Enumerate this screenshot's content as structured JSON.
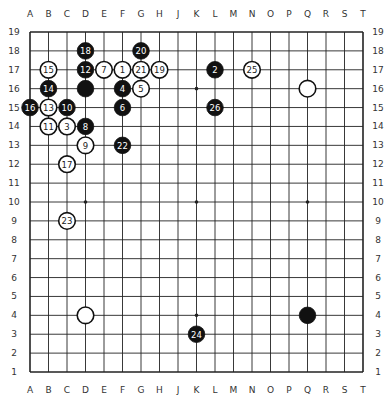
{
  "board": {
    "size": 19,
    "columns": [
      "A",
      "B",
      "C",
      "D",
      "E",
      "F",
      "G",
      "H",
      "J",
      "K",
      "L",
      "M",
      "N",
      "O",
      "P",
      "Q",
      "R",
      "S",
      "T"
    ],
    "rows": [
      "19",
      "18",
      "17",
      "16",
      "15",
      "14",
      "13",
      "12",
      "11",
      "10",
      "9",
      "8",
      "7",
      "6",
      "5",
      "4",
      "3",
      "2",
      "1"
    ],
    "star_points": [
      "D16",
      "K16",
      "Q16",
      "D10",
      "K10",
      "Q10",
      "D4",
      "K4",
      "Q4"
    ],
    "colors": {
      "background": "#ffffff",
      "line": "#222222",
      "black_stone": "#111111",
      "white_stone": "#ffffff",
      "label": "#333333"
    }
  },
  "stones": [
    {
      "pos": "F17",
      "color": "white",
      "num": "1"
    },
    {
      "pos": "L17",
      "color": "black",
      "num": "2"
    },
    {
      "pos": "C14",
      "color": "white",
      "num": "3"
    },
    {
      "pos": "F16",
      "color": "black",
      "num": "4"
    },
    {
      "pos": "G16",
      "color": "white",
      "num": "5"
    },
    {
      "pos": "F15",
      "color": "black",
      "num": "6"
    },
    {
      "pos": "E17",
      "color": "white",
      "num": "7"
    },
    {
      "pos": "D14",
      "color": "black",
      "num": "8"
    },
    {
      "pos": "D13",
      "color": "white",
      "num": "9"
    },
    {
      "pos": "C15",
      "color": "black",
      "num": "10"
    },
    {
      "pos": "B14",
      "color": "white",
      "num": "11"
    },
    {
      "pos": "D17",
      "color": "black",
      "num": "12"
    },
    {
      "pos": "B15",
      "color": "white",
      "num": "13"
    },
    {
      "pos": "B16",
      "color": "black",
      "num": "14"
    },
    {
      "pos": "B17",
      "color": "white",
      "num": "15"
    },
    {
      "pos": "A15",
      "color": "black",
      "num": "16"
    },
    {
      "pos": "C12",
      "color": "white",
      "num": "17"
    },
    {
      "pos": "D18",
      "color": "black",
      "num": "18"
    },
    {
      "pos": "H17",
      "color": "white",
      "num": "19"
    },
    {
      "pos": "G18",
      "color": "black",
      "num": "20"
    },
    {
      "pos": "G17",
      "color": "white",
      "num": "21"
    },
    {
      "pos": "F13",
      "color": "black",
      "num": "22"
    },
    {
      "pos": "C9",
      "color": "white",
      "num": "23"
    },
    {
      "pos": "K3",
      "color": "black",
      "num": "24"
    },
    {
      "pos": "N17",
      "color": "white",
      "num": "25"
    },
    {
      "pos": "L15",
      "color": "black",
      "num": "26"
    },
    {
      "pos": "D16",
      "color": "black",
      "num": ""
    },
    {
      "pos": "Q16",
      "color": "white",
      "num": ""
    },
    {
      "pos": "D4",
      "color": "white",
      "num": ""
    },
    {
      "pos": "Q4",
      "color": "black",
      "num": ""
    }
  ]
}
